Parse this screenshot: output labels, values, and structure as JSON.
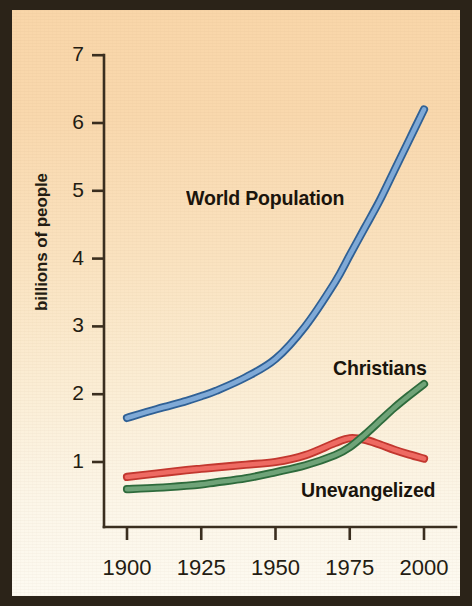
{
  "figure": {
    "background_top_color": "#F9D6A9",
    "background_bottom_color": "#FDFAF1",
    "frame_color": "#2B2318",
    "axis_color": "#3A2E1F"
  },
  "axes": {
    "y_axis_title": "billions of people",
    "y_ticks": [
      "1",
      "2",
      "3",
      "4",
      "5",
      "6",
      "7"
    ],
    "x_ticks": [
      "1900",
      "1925",
      "1950",
      "1975",
      "2000"
    ]
  },
  "labels": {
    "world_population": "World Population",
    "christians": "Christians",
    "unevangelized": "Unevangelized"
  },
  "chart_data": {
    "type": "line",
    "title": "",
    "xlabel": "",
    "ylabel": "billions of people",
    "xlim": [
      1900,
      2000
    ],
    "ylim": [
      0,
      7
    ],
    "xticks": [
      1900,
      1925,
      1950,
      1975,
      2000
    ],
    "yticks": [
      1,
      2,
      3,
      4,
      5,
      6,
      7
    ],
    "grid": false,
    "legend": "inline-annotations",
    "x": [
      1900,
      1910,
      1920,
      1925,
      1930,
      1940,
      1950,
      1960,
      1970,
      1975,
      1980,
      1985,
      1990,
      1995,
      2000
    ],
    "series": [
      {
        "name": "World Population",
        "color": "#7FA9D6",
        "outline_color": "#2F6095",
        "label_position": "upper-center",
        "values": [
          1.65,
          1.78,
          1.9,
          1.97,
          2.05,
          2.25,
          2.52,
          3.0,
          3.65,
          4.05,
          4.45,
          4.85,
          5.3,
          5.75,
          6.2
        ]
      },
      {
        "name": "Unevangelized",
        "color": "#EE6A62",
        "outline_color": "#C2372F",
        "label_position": "lower-right",
        "values": [
          0.78,
          0.83,
          0.88,
          0.9,
          0.92,
          0.96,
          1.0,
          1.1,
          1.28,
          1.35,
          1.33,
          1.26,
          1.18,
          1.11,
          1.05
        ]
      },
      {
        "name": "Christians",
        "color": "#6FA378",
        "outline_color": "#2E6B3C",
        "label_position": "right",
        "values": [
          0.6,
          0.62,
          0.65,
          0.67,
          0.7,
          0.76,
          0.85,
          0.95,
          1.1,
          1.22,
          1.4,
          1.6,
          1.8,
          1.98,
          2.15
        ]
      }
    ]
  }
}
